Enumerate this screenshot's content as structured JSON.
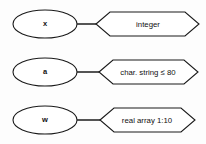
{
  "diagram": {
    "background_color": "#fdfdfd",
    "line_color": "#1a1a1a",
    "text_color": "#111111",
    "rows": [
      {
        "variable": "x",
        "type": "integer",
        "variable_shape": "ellipse",
        "type_shape": "hexagon"
      },
      {
        "variable": "a",
        "type": "char. string ≤ 80",
        "variable_shape": "ellipse",
        "type_shape": "hexagon"
      },
      {
        "variable": "w",
        "type": "real array 1:10",
        "variable_shape": "ellipse",
        "type_shape": "hexagon"
      }
    ]
  }
}
